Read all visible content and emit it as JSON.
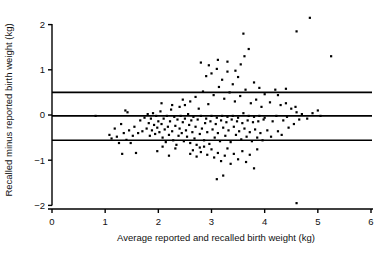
{
  "chart_data": {
    "type": "scatter",
    "title": "",
    "xlabel": "Average reported and recalled birth weight (kg)",
    "ylabel": "Recalled minus reported birth weight (kg)",
    "xlim": [
      0,
      6
    ],
    "ylim": [
      -2.2,
      2.35
    ],
    "xticks": [
      0,
      1,
      2,
      3,
      4,
      5,
      6
    ],
    "xtick_labels": [
      "0",
      "1",
      "2",
      "3",
      "4",
      "5",
      "6"
    ],
    "yticks": [
      2,
      1,
      0,
      -1,
      -2
    ],
    "ytick_labels": [
      "2",
      "1",
      "0",
      "-1",
      "-2"
    ],
    "grid": false,
    "legend": null,
    "marker": "square",
    "marker_color": "#000000",
    "marker_size_px": 2.2,
    "reference_lines": [
      {
        "name": "upper-limit-of-agreement",
        "y": 0.5,
        "color": "#000000",
        "width": 1.6
      },
      {
        "name": "mean-bias",
        "y": -0.02,
        "color": "#000000",
        "width": 1.6
      },
      {
        "name": "lower-limit-of-agreement",
        "y": -0.56,
        "color": "#000000",
        "width": 1.6
      }
    ],
    "axis_color": "#000000",
    "points": [
      [
        0.82,
        -0.02
      ],
      [
        1.08,
        -0.44
      ],
      [
        1.12,
        -0.52
      ],
      [
        1.18,
        -0.3
      ],
      [
        1.22,
        -0.48
      ],
      [
        1.26,
        -0.62
      ],
      [
        1.3,
        -0.2
      ],
      [
        1.32,
        -0.86
      ],
      [
        1.35,
        -0.4
      ],
      [
        1.38,
        0.1
      ],
      [
        1.4,
        -0.55
      ],
      [
        1.42,
        0.06
      ],
      [
        1.45,
        -0.34
      ],
      [
        1.48,
        -0.62
      ],
      [
        1.52,
        -0.46
      ],
      [
        1.55,
        -0.26
      ],
      [
        1.58,
        -0.84
      ],
      [
        1.62,
        -0.4
      ],
      [
        1.66,
        -0.12
      ],
      [
        1.7,
        -0.36
      ],
      [
        1.74,
        -0.06
      ],
      [
        1.78,
        -0.3
      ],
      [
        1.8,
        0.02
      ],
      [
        1.82,
        -0.18
      ],
      [
        1.84,
        -0.46
      ],
      [
        1.86,
        -0.08
      ],
      [
        1.88,
        -0.34
      ],
      [
        1.9,
        0.04
      ],
      [
        1.92,
        -0.22
      ],
      [
        1.94,
        -0.42
      ],
      [
        1.96,
        -0.02
      ],
      [
        1.98,
        -0.28
      ],
      [
        2.0,
        -0.14
      ],
      [
        2.02,
        -0.38
      ],
      [
        2.04,
        0.08
      ],
      [
        2.06,
        -0.2
      ],
      [
        2.08,
        -0.5
      ],
      [
        2.1,
        -0.08
      ],
      [
        2.12,
        -0.32
      ],
      [
        2.14,
        -0.6
      ],
      [
        2.16,
        -0.02
      ],
      [
        2.18,
        -0.26
      ],
      [
        2.2,
        -0.44
      ],
      [
        2.22,
        -0.14
      ],
      [
        2.24,
        0.12
      ],
      [
        2.26,
        -0.36
      ],
      [
        2.28,
        -0.56
      ],
      [
        2.3,
        -0.04
      ],
      [
        2.32,
        -0.24
      ],
      [
        2.34,
        -0.66
      ],
      [
        2.36,
        -0.1
      ],
      [
        2.38,
        -0.46
      ],
      [
        2.4,
        0.18
      ],
      [
        2.4,
        -0.3
      ],
      [
        2.42,
        -0.02
      ],
      [
        2.44,
        -0.4
      ],
      [
        2.46,
        -0.16
      ],
      [
        2.48,
        -0.58
      ],
      [
        2.5,
        0.22
      ],
      [
        2.5,
        -0.08
      ],
      [
        2.52,
        -0.34
      ],
      [
        2.54,
        -0.48
      ],
      [
        2.56,
        0.02
      ],
      [
        2.58,
        -0.22
      ],
      [
        2.6,
        -0.62
      ],
      [
        2.6,
        0.3
      ],
      [
        2.62,
        -0.12
      ],
      [
        2.64,
        -0.38
      ],
      [
        2.66,
        -0.04
      ],
      [
        2.68,
        -0.52
      ],
      [
        2.7,
        0.4
      ],
      [
        2.7,
        -0.26
      ],
      [
        2.72,
        -0.66
      ],
      [
        2.74,
        -0.1
      ],
      [
        2.76,
        0.14
      ],
      [
        2.78,
        -0.42
      ],
      [
        2.78,
        -0.72
      ],
      [
        2.8,
        1.16
      ],
      [
        2.8,
        -0.02
      ],
      [
        2.82,
        -0.3
      ],
      [
        2.84,
        0.52
      ],
      [
        2.86,
        -0.56
      ],
      [
        2.88,
        -0.18
      ],
      [
        2.9,
        0.86
      ],
      [
        2.9,
        -0.08
      ],
      [
        2.92,
        -0.38
      ],
      [
        2.94,
        0.24
      ],
      [
        2.96,
        -0.64
      ],
      [
        2.98,
        -0.14
      ],
      [
        3.0,
        0.92
      ],
      [
        3.0,
        -0.02
      ],
      [
        3.02,
        -0.32
      ],
      [
        3.04,
        0.44
      ],
      [
        3.06,
        -0.5
      ],
      [
        3.08,
        -0.2
      ],
      [
        3.1,
        1.02
      ],
      [
        3.1,
        -0.06
      ],
      [
        3.12,
        -0.4
      ],
      [
        3.14,
        0.62
      ],
      [
        3.16,
        -0.58
      ],
      [
        3.18,
        -0.12
      ],
      [
        3.2,
        0.78
      ],
      [
        3.2,
        -0.02
      ],
      [
        3.22,
        -0.28
      ],
      [
        3.24,
        0.36
      ],
      [
        3.26,
        -0.46
      ],
      [
        3.28,
        -0.16
      ],
      [
        3.3,
        0.96
      ],
      [
        3.3,
        -0.04
      ],
      [
        3.32,
        -0.34
      ],
      [
        3.34,
        0.5
      ],
      [
        3.36,
        -0.6
      ],
      [
        3.38,
        -0.1
      ],
      [
        3.4,
        0.68
      ],
      [
        3.4,
        -0.02
      ],
      [
        3.42,
        -0.26
      ],
      [
        3.44,
        0.3
      ],
      [
        3.46,
        -0.44
      ],
      [
        3.48,
        -0.14
      ],
      [
        3.5,
        0.84
      ],
      [
        3.5,
        -0.06
      ],
      [
        3.52,
        -0.36
      ],
      [
        3.54,
        0.42
      ],
      [
        3.56,
        -0.54
      ],
      [
        3.58,
        -0.18
      ],
      [
        3.6,
        1.8
      ],
      [
        3.6,
        0.04
      ],
      [
        3.62,
        -0.3
      ],
      [
        3.64,
        0.56
      ],
      [
        3.66,
        -0.48
      ],
      [
        3.68,
        -0.12
      ],
      [
        3.7,
        1.46
      ],
      [
        3.7,
        -0.02
      ],
      [
        3.72,
        -0.38
      ],
      [
        3.74,
        0.26
      ],
      [
        3.76,
        -0.58
      ],
      [
        3.78,
        -0.16
      ],
      [
        3.8,
        0.72
      ],
      [
        3.8,
        -0.04
      ],
      [
        3.82,
        -0.32
      ],
      [
        3.84,
        0.34
      ],
      [
        3.86,
        -0.5
      ],
      [
        3.88,
        -0.14
      ],
      [
        3.9,
        0.6
      ],
      [
        3.9,
        -0.02
      ],
      [
        3.92,
        -0.4
      ],
      [
        3.94,
        0.18
      ],
      [
        3.96,
        -0.56
      ],
      [
        3.98,
        -0.1
      ],
      [
        4.0,
        0.46
      ],
      [
        4.0,
        -0.06
      ],
      [
        4.05,
        -0.34
      ],
      [
        4.1,
        0.28
      ],
      [
        4.12,
        -0.48
      ],
      [
        4.15,
        -0.14
      ],
      [
        4.2,
        0.56
      ],
      [
        4.22,
        -0.02
      ],
      [
        4.25,
        -0.36
      ],
      [
        4.3,
        0.22
      ],
      [
        4.32,
        -0.44
      ],
      [
        4.35,
        -0.12
      ],
      [
        4.4,
        0.58
      ],
      [
        4.42,
        -0.04
      ],
      [
        4.45,
        -0.28
      ],
      [
        4.5,
        0.14
      ],
      [
        4.55,
        -0.2
      ],
      [
        4.6,
        0.06
      ],
      [
        4.65,
        -0.1
      ],
      [
        4.7,
        0.02
      ],
      [
        4.8,
        -0.08
      ],
      [
        4.9,
        0.04
      ],
      [
        5.0,
        0.1
      ],
      [
        5.05,
        -0.02
      ],
      [
        2.6,
        -0.86
      ],
      [
        2.65,
        -0.78
      ],
      [
        2.72,
        -0.92
      ],
      [
        2.8,
        -0.82
      ],
      [
        2.86,
        -0.7
      ],
      [
        2.92,
        -0.88
      ],
      [
        3.0,
        -0.76
      ],
      [
        3.05,
        -0.94
      ],
      [
        3.12,
        -0.84
      ],
      [
        3.18,
        -1.02
      ],
      [
        3.1,
        -1.42
      ],
      [
        3.22,
        -1.34
      ],
      [
        3.25,
        -0.9
      ],
      [
        3.3,
        -0.74
      ],
      [
        3.36,
        -1.08
      ],
      [
        3.42,
        -0.86
      ],
      [
        3.5,
        -0.98
      ],
      [
        3.58,
        -0.8
      ],
      [
        3.65,
        -1.04
      ],
      [
        3.72,
        -0.88
      ],
      [
        3.8,
        -1.18
      ],
      [
        3.86,
        -0.76
      ],
      [
        2.2,
        -0.9
      ],
      [
        2.32,
        -0.74
      ],
      [
        2.08,
        -0.7
      ],
      [
        1.98,
        -0.8
      ],
      [
        4.85,
        2.15
      ],
      [
        4.6,
        1.85
      ],
      [
        5.25,
        1.3
      ],
      [
        4.6,
        -1.95
      ],
      [
        3.62,
        1.3
      ],
      [
        3.55,
        1.12
      ],
      [
        3.3,
        1.18
      ],
      [
        2.95,
        1.1
      ],
      [
        3.45,
        0.98
      ],
      [
        3.12,
        1.22
      ],
      [
        4.25,
        0.44
      ],
      [
        4.4,
        0.26
      ],
      [
        4.58,
        0.18
      ],
      [
        2.46,
        0.34
      ],
      [
        2.26,
        0.22
      ],
      [
        2.06,
        0.26
      ]
    ]
  }
}
